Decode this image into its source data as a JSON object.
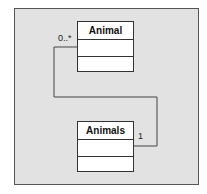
{
  "diagram": {
    "classes": [
      {
        "name": "Animal"
      },
      {
        "name": "Animals"
      }
    ],
    "association": {
      "end_animal_multiplicity": "0..*",
      "end_animals_multiplicity": "1"
    }
  }
}
